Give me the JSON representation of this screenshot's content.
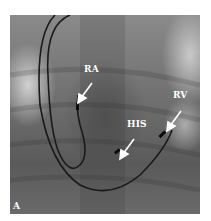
{
  "figure": {
    "panel_label": "A",
    "annotations": [
      {
        "label": "RA"
      },
      {
        "label": "HIS"
      },
      {
        "label": "RV"
      }
    ]
  },
  "colors": {
    "background": "#ffffff",
    "image_base": "#6e6e6e",
    "lead": "#1a1a1a",
    "annotation": "#ffffff"
  }
}
